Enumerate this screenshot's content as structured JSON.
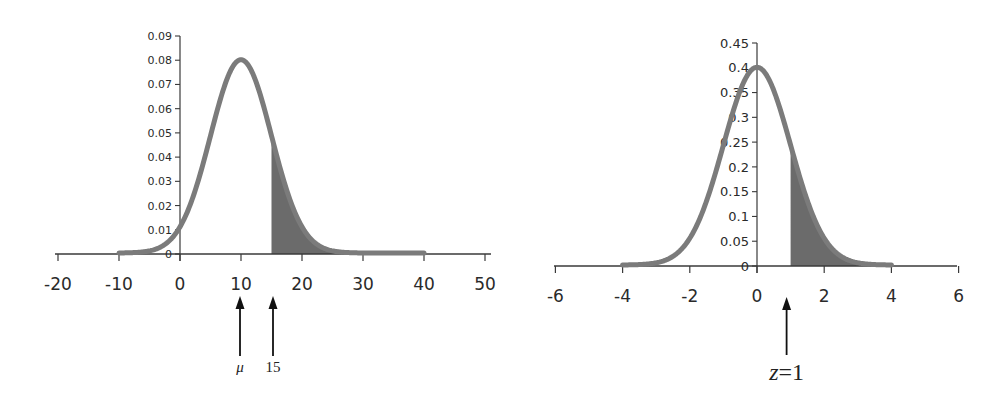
{
  "chart_data": [
    {
      "type": "line",
      "title": "",
      "description": "Normal distribution N(mu=10, sigma=5) with shaded right tail area for x >= 15",
      "xlabel": "",
      "ylabel": "",
      "mean": 10,
      "sd": 5,
      "x_range_curve": [
        -10,
        40
      ],
      "shade_from": 15,
      "shade_to": 40,
      "xlim": [
        -20,
        50
      ],
      "ylim": [
        0,
        0.09
      ],
      "x_ticks": [
        -20,
        -10,
        0,
        10,
        20,
        30,
        40,
        50
      ],
      "x_tick_labels": [
        "-20",
        "-10",
        "0",
        "10",
        "20",
        "30",
        "40",
        "50"
      ],
      "y_ticks": [
        0,
        0.01,
        0.02,
        0.03,
        0.04,
        0.05,
        0.06,
        0.07,
        0.08,
        0.09
      ],
      "y_tick_labels": [
        "0",
        "0.01",
        "0.02",
        "0.03",
        "0.04",
        "0.05",
        "0.06",
        "0.07",
        "0.08",
        "0.09"
      ],
      "grid": false,
      "legend": null,
      "annotations": [
        {
          "label": "μ",
          "x": 10,
          "type": "arrow-up"
        },
        {
          "label": "15",
          "x": 15,
          "type": "arrow-up"
        }
      ],
      "series": [
        {
          "name": "density",
          "x": [
            -10,
            -5,
            0,
            5,
            10,
            15,
            20,
            25,
            30,
            35,
            40
          ],
          "values": [
            0.0009,
            0.0036,
            0.0108,
            0.0484,
            0.0798,
            0.0484,
            0.0108,
            0.0009,
            3e-05,
            0.0,
            0.0
          ]
        }
      ]
    },
    {
      "type": "line",
      "title": "",
      "description": "Standard normal distribution N(0,1) with shaded right tail area for z >= 1",
      "xlabel": "",
      "ylabel": "",
      "mean": 0,
      "sd": 1,
      "x_range_curve": [
        -4,
        4
      ],
      "shade_from": 1,
      "shade_to": 4,
      "xlim": [
        -6,
        6
      ],
      "ylim": [
        0,
        0.45
      ],
      "x_ticks": [
        -6,
        -4,
        -2,
        0,
        2,
        4,
        6
      ],
      "x_tick_labels": [
        "-6",
        "-4",
        "-2",
        "0",
        "2",
        "4",
        "6"
      ],
      "y_ticks": [
        0,
        0.05,
        0.1,
        0.15,
        0.2,
        0.25,
        0.3,
        0.35,
        0.4,
        0.45
      ],
      "y_tick_labels": [
        "0",
        "0.05",
        "0.1",
        "0.15",
        "0.2",
        "0.25",
        "0.3",
        "0.35",
        "0.4",
        "0.45"
      ],
      "grid": false,
      "legend": null,
      "annotations": [
        {
          "label": "z=1",
          "x": 1,
          "type": "arrow-up"
        }
      ],
      "series": [
        {
          "name": "density",
          "x": [
            -4,
            -3,
            -2,
            -1,
            0,
            1,
            2,
            3,
            4
          ],
          "values": [
            0.0001,
            0.0044,
            0.054,
            0.242,
            0.399,
            0.242,
            0.054,
            0.0044,
            0.0001
          ]
        }
      ]
    }
  ],
  "style": {
    "curve_color": "#7b7b7b",
    "shade_color": "#6b6b6b",
    "axis_color": "#3a3a3a",
    "arrow_color": "#111111"
  },
  "layout": [
    {
      "x0": 180,
      "xscale": 6.1,
      "y0": 254,
      "ymax_px": 36,
      "axis_left": 55,
      "axis_right": 491,
      "arrow_y_top": 296,
      "arrow_y_bottom": 356,
      "ann_label_y": 372,
      "xtick_label_y": 290,
      "ytick_font": 11,
      "xtick_font": 17
    },
    {
      "x0": 757,
      "xscale": 33.6,
      "y0": 266,
      "ymax_px": 43,
      "axis_left": 554,
      "axis_right": 957,
      "arrow_y_top": 297,
      "arrow_y_bottom": 355,
      "ann_label_y": 380,
      "xtick_label_y": 302,
      "ytick_font": 13,
      "xtick_font": 17
    }
  ]
}
